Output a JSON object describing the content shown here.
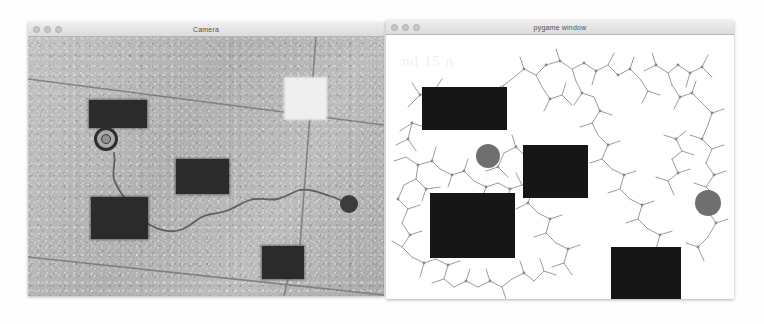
{
  "page": {
    "background": "#fefefe",
    "width": 764,
    "height": 324
  },
  "windows": [
    {
      "id": "camera",
      "title": "Camera",
      "controls": [
        "close",
        "minimize",
        "zoom"
      ],
      "bounds": {
        "left": 28,
        "top": 22,
        "width": 356,
        "height": 274
      },
      "content_type": "camera-feed"
    },
    {
      "id": "pygame",
      "title": "pygame window",
      "controls": [
        "close",
        "minimize",
        "zoom"
      ],
      "bounds": {
        "left": 386,
        "top": 20,
        "width": 348,
        "height": 279
      },
      "content_type": "rrt-planner-canvas"
    }
  ],
  "camera_view": {
    "background_color": "#b4b4b4",
    "obstacles": [
      {
        "x": 61,
        "y": 63,
        "w": 58,
        "h": 28
      },
      {
        "x": 148,
        "y": 122,
        "w": 53,
        "h": 35
      },
      {
        "x": 63,
        "y": 160,
        "w": 57,
        "h": 42
      },
      {
        "x": 234,
        "y": 209,
        "w": 42,
        "h": 33
      }
    ],
    "bright_square": {
      "x": 256,
      "y": 40,
      "w": 43,
      "h": 43,
      "color": "#efefef"
    },
    "robot_marker": {
      "x": 78,
      "y": 102,
      "r": 12,
      "color": "#2e2e2e"
    },
    "goal_marker": {
      "x": 321,
      "y": 167,
      "r": 9,
      "color": "#3c3c3c"
    },
    "grout_lines": [
      {
        "x1": 0,
        "y1": 42,
        "x2": 356,
        "y2": 86
      },
      {
        "x1": 0,
        "y1": 222,
        "x2": 356,
        "y2": 259
      },
      {
        "x1": 286,
        "y1": 0,
        "x2": 272,
        "y2": 210
      },
      {
        "x1": 268,
        "y1": 210,
        "x2": 259,
        "y2": 259
      }
    ],
    "traced_path_color": "#5a5a5a"
  },
  "pygame_view": {
    "background_color": "#ffffff",
    "tree_color": "#9a9a9a",
    "node_color": "#8a8a8a",
    "obstacles": [
      {
        "x": 36,
        "y": 52,
        "w": 85,
        "h": 43
      },
      {
        "x": 137,
        "y": 110,
        "w": 65,
        "h": 53
      },
      {
        "x": 44,
        "y": 158,
        "w": 85,
        "h": 65
      },
      {
        "x": 225,
        "y": 212,
        "w": 70,
        "h": 52
      }
    ],
    "start_circle": {
      "x": 102,
      "y": 121,
      "r": 12,
      "color": "#6f6f6f"
    },
    "goal_circle": {
      "x": 322,
      "y": 168,
      "r": 13,
      "color": "#6f6f6f"
    },
    "ghost_text": "nd 15 n"
  }
}
